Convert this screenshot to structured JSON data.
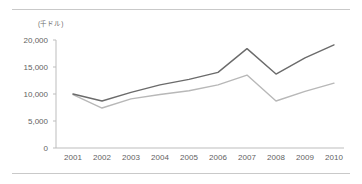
{
  "unit_label": "(千ドル)",
  "axis": {
    "y_ticks": [
      "20,000",
      "15,000",
      "10,000",
      "5,000",
      "0"
    ],
    "x_ticks": [
      "2001",
      "2002",
      "2003",
      "2004",
      "2005",
      "2006",
      "2007",
      "2008",
      "2009",
      "2010"
    ]
  },
  "colors": {
    "series_upper": "#6b6b6b",
    "series_lower": "#b8b8b8",
    "axis_line": "#bdbdbd",
    "frame_line": "#c9c9c9",
    "tick_text": "#5f5f5f",
    "unit_text": "#6d6d6d"
  },
  "chart_data": {
    "type": "line",
    "title": "",
    "xlabel": "",
    "ylabel": "(千ドル)",
    "categories": [
      "2001",
      "2002",
      "2003",
      "2004",
      "2005",
      "2006",
      "2007",
      "2008",
      "2009",
      "2010"
    ],
    "x": [
      2001,
      2002,
      2003,
      2004,
      2005,
      2006,
      2007,
      2008,
      2009,
      2010
    ],
    "ylim": [
      0,
      20000
    ],
    "y_tick_values": [
      0,
      5000,
      10000,
      15000,
      20000
    ],
    "grid": false,
    "legend": "none",
    "series": [
      {
        "name": "series-upper",
        "color": "#6b6b6b",
        "values": [
          10000,
          8700,
          10300,
          11700,
          12700,
          14000,
          18400,
          13700,
          16700,
          19100
        ]
      },
      {
        "name": "series-lower",
        "color": "#b8b8b8",
        "values": [
          9900,
          7400,
          9100,
          9900,
          10600,
          11700,
          13500,
          8700,
          10500,
          12000
        ]
      }
    ]
  }
}
